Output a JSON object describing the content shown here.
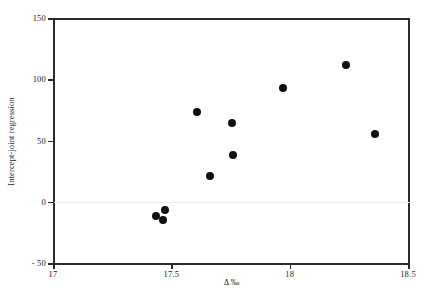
{
  "chart_data": {
    "type": "scatter",
    "title": "",
    "xlabel": "Δ ‰",
    "ylabel": "Intercept-joint regression",
    "xlim": [
      17,
      18.5
    ],
    "ylim": [
      -50,
      150
    ],
    "xticks": [
      17,
      17.5,
      18,
      18.5
    ],
    "xticklabels": [
      "17",
      "17.5",
      "18",
      "18.5"
    ],
    "yticks": [
      -50,
      0,
      50,
      100,
      150
    ],
    "yticklabels": [
      "- 50",
      "0",
      "50",
      "100",
      "150"
    ],
    "grid": false,
    "legend": null,
    "zero_reference_line": true,
    "marker": {
      "shape": "circle",
      "color": "#111111",
      "size_px": 8
    },
    "series": [
      {
        "name": "Intercept-joint regression",
        "points": [
          {
            "x": 17.437,
            "y": -12
          },
          {
            "x": 17.466,
            "y": -15
          },
          {
            "x": 17.475,
            "y": -7
          },
          {
            "x": 17.607,
            "y": 73
          },
          {
            "x": 17.664,
            "y": 21
          },
          {
            "x": 17.756,
            "y": 64
          },
          {
            "x": 17.76,
            "y": 38
          },
          {
            "x": 17.971,
            "y": 93
          },
          {
            "x": 18.24,
            "y": 112
          },
          {
            "x": 18.362,
            "y": 55
          }
        ]
      }
    ]
  },
  "figure": {
    "background_color": "#ffffff",
    "axis_color": "#2b2b2b",
    "zero_line_color": "#ececec"
  }
}
